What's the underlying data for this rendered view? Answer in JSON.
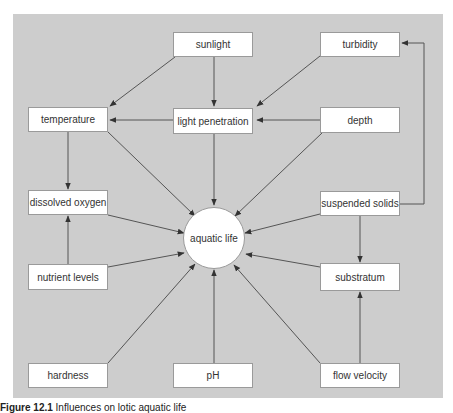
{
  "diagram": {
    "hub": {
      "id": "aquatic_life",
      "label": "aquatic life"
    },
    "nodes": [
      {
        "id": "sunlight",
        "label": "sunlight"
      },
      {
        "id": "turbidity",
        "label": "turbidity"
      },
      {
        "id": "temperature",
        "label": "temperature"
      },
      {
        "id": "light_penetration",
        "label": "light penetration"
      },
      {
        "id": "depth",
        "label": "depth"
      },
      {
        "id": "dissolved_oxygen",
        "label": "dissolved oxygen"
      },
      {
        "id": "suspended_solids",
        "label": "suspended solids"
      },
      {
        "id": "nutrient_levels",
        "label": "nutrient levels"
      },
      {
        "id": "substratum",
        "label": "substratum"
      },
      {
        "id": "hardness",
        "label": "hardness"
      },
      {
        "id": "ph",
        "label": "pH"
      },
      {
        "id": "flow_velocity",
        "label": "flow velocity"
      }
    ],
    "edges": [
      {
        "from": "sunlight",
        "to": "temperature"
      },
      {
        "from": "sunlight",
        "to": "light_penetration"
      },
      {
        "from": "turbidity",
        "to": "light_penetration"
      },
      {
        "from": "light_penetration",
        "to": "temperature"
      },
      {
        "from": "depth",
        "to": "light_penetration"
      },
      {
        "from": "temperature",
        "to": "dissolved_oxygen"
      },
      {
        "from": "temperature",
        "to": "aquatic_life"
      },
      {
        "from": "light_penetration",
        "to": "aquatic_life"
      },
      {
        "from": "depth",
        "to": "aquatic_life"
      },
      {
        "from": "dissolved_oxygen",
        "to": "aquatic_life"
      },
      {
        "from": "suspended_solids",
        "to": "aquatic_life"
      },
      {
        "from": "suspended_solids",
        "to": "turbidity"
      },
      {
        "from": "suspended_solids",
        "to": "substratum"
      },
      {
        "from": "nutrient_levels",
        "to": "dissolved_oxygen"
      },
      {
        "from": "nutrient_levels",
        "to": "aquatic_life"
      },
      {
        "from": "substratum",
        "to": "aquatic_life"
      },
      {
        "from": "hardness",
        "to": "aquatic_life"
      },
      {
        "from": "ph",
        "to": "aquatic_life"
      },
      {
        "from": "flow_velocity",
        "to": "aquatic_life"
      },
      {
        "from": "flow_velocity",
        "to": "substratum"
      }
    ],
    "caption": {
      "prefix": "Figure 12.1",
      "text": "Influences on lotic aquatic life"
    }
  },
  "colors": {
    "panel": "#cdcdcd",
    "box": "#ffffff",
    "line": "#555555"
  }
}
